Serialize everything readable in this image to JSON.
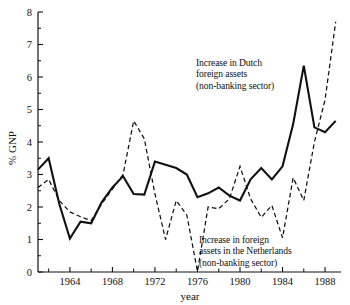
{
  "chart_data": {
    "type": "line",
    "title": "",
    "xlabel": "year",
    "ylabel": "% GNP",
    "xlim": [
      1961,
      1989.5
    ],
    "ylim": [
      0,
      8
    ],
    "grid": false,
    "legend": "annotations-inline",
    "x_ticks_major": [
      1964,
      1968,
      1972,
      1976,
      1980,
      1984,
      1988
    ],
    "x_ticks_minor": [
      1962,
      1966,
      1970,
      1974,
      1978,
      1982,
      1986
    ],
    "x_tick_labels": [
      "1964",
      "1968",
      "1972",
      "1976",
      "1980",
      "1984",
      "1988"
    ],
    "y_ticks_major": [
      0,
      1,
      2,
      3,
      4,
      5,
      6,
      7,
      8
    ],
    "y_tick_labels": [
      "0",
      "1",
      "2",
      "3",
      "4",
      "5",
      "6",
      "7",
      "8"
    ],
    "y_ticks_minor": [
      0.5,
      1.5,
      2.5,
      3.5,
      4.5,
      5.5,
      6.5,
      7.5
    ],
    "x": [
      1961,
      1962,
      1963,
      1964,
      1965,
      1966,
      1967,
      1968,
      1969,
      1970,
      1971,
      1972,
      1973,
      1974,
      1975,
      1976,
      1977,
      1978,
      1979,
      1980,
      1981,
      1982,
      1983,
      1984,
      1985,
      1986,
      1987,
      1988,
      1989
    ],
    "series": [
      {
        "name": "Increase in Dutch foreign assets (non-banking sector)",
        "style": "solid",
        "color": "#111111",
        "values": [
          3.15,
          3.5,
          2.1,
          1.03,
          1.55,
          1.5,
          2.15,
          2.6,
          2.95,
          2.4,
          2.38,
          3.4,
          3.3,
          3.2,
          3.0,
          2.3,
          2.42,
          2.6,
          2.35,
          2.2,
          2.85,
          3.2,
          2.85,
          3.25,
          4.55,
          6.35,
          4.45,
          4.3,
          4.65
        ]
      },
      {
        "name": "Increase in foreign assets in the Netherlands (non-banking sector)",
        "style": "dashed",
        "color": "#111111",
        "values": [
          2.6,
          2.85,
          2.2,
          1.85,
          1.7,
          1.58,
          2.1,
          2.55,
          3.0,
          4.65,
          4.1,
          2.4,
          1.0,
          2.2,
          1.75,
          0.02,
          2.0,
          1.95,
          2.25,
          3.25,
          2.25,
          1.68,
          2.05,
          1.05,
          2.9,
          2.2,
          4.0,
          5.3,
          7.7
        ]
      }
    ],
    "annotations": [
      {
        "id": "dutch",
        "lines": [
          "Increase in Dutch",
          "foreign assets",
          "(non-banking sector)"
        ]
      },
      {
        "id": "netherlands",
        "lines": [
          "Increase in foreign",
          "assets in the Netherlands",
          "(non-banking sector)"
        ]
      }
    ]
  }
}
